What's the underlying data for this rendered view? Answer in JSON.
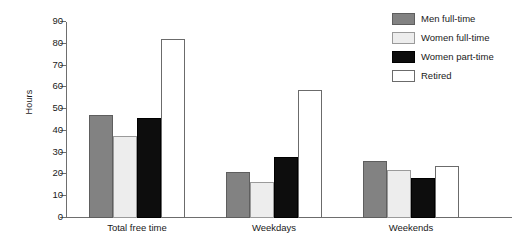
{
  "chart_data": {
    "type": "bar",
    "title": "",
    "xlabel": "",
    "ylabel": "Hours",
    "ylim": [
      0,
      90
    ],
    "yticks": [
      0,
      10,
      20,
      30,
      40,
      50,
      60,
      70,
      80,
      90
    ],
    "grid": false,
    "legend_position": "top-right",
    "categories": [
      "Total free time",
      "Weekdays",
      "Weekends"
    ],
    "series": [
      {
        "name": "Men full-time",
        "color": "#828282",
        "values": [
          47.5,
          21.0,
          26.0
        ]
      },
      {
        "name": "Women full-time",
        "color": "#ededed",
        "values": [
          37.5,
          16.5,
          22.0
        ]
      },
      {
        "name": "Women part-time",
        "color": "#0d0d0d",
        "values": [
          46.0,
          28.0,
          18.5
        ]
      },
      {
        "name": "Retired",
        "color": "#ffffff",
        "values": [
          82.0,
          59.0,
          24.0
        ]
      }
    ]
  }
}
